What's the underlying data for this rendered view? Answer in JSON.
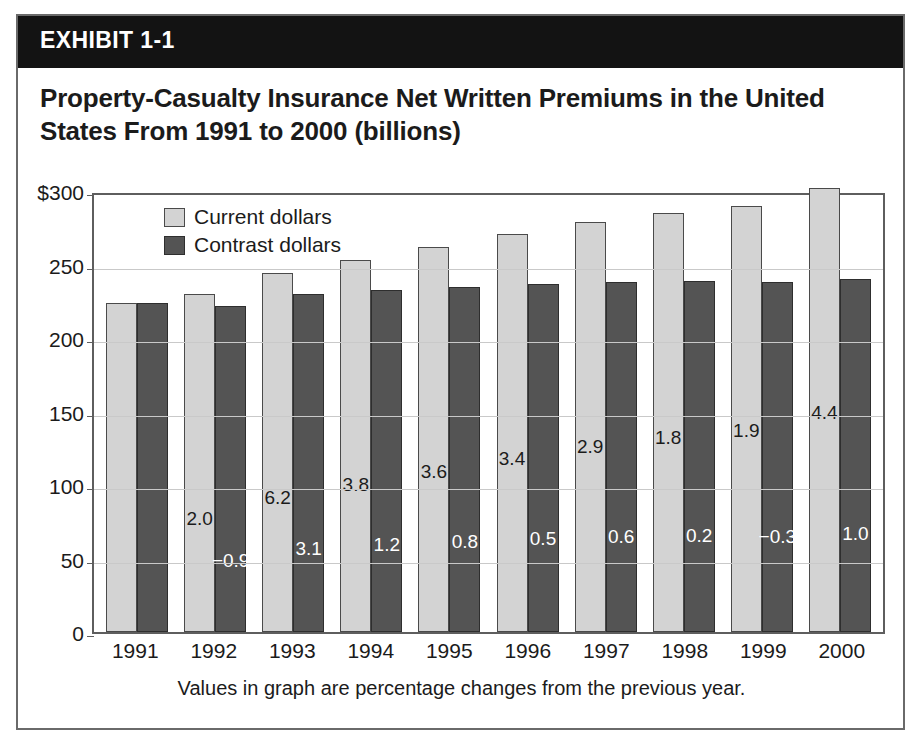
{
  "exhibit": {
    "band_label": "EXHIBIT 1-1",
    "title": "Property-Casualty Insurance Net Written Premiums in the United States From 1991 to 2000 (billions)"
  },
  "chart_data": {
    "type": "bar",
    "title": "Property-Casualty Insurance Net Written Premiums in the United States From 1991 to 2000 (billions)",
    "xlabel": "",
    "ylabel": "",
    "ylim": [
      0,
      300
    ],
    "yticks": [
      "$300",
      "250",
      "200",
      "150",
      "100",
      "50",
      "0"
    ],
    "ytick_values": [
      300,
      250,
      200,
      150,
      100,
      50,
      0
    ],
    "grid": true,
    "legend_position": "top-left",
    "categories": [
      "1991",
      "1992",
      "1993",
      "1994",
      "1995",
      "1996",
      "1997",
      "1998",
      "1999",
      "2000"
    ],
    "series": [
      {
        "name": "Current dollars",
        "color": "#d3d3d3",
        "values": [
          224,
          230,
          244,
          253,
          262,
          271,
          279,
          285,
          290,
          302
        ],
        "point_labels": [
          "",
          "2.0",
          "6.2",
          "3.8",
          "3.6",
          "3.4",
          "2.9",
          "1.8",
          "1.9",
          "4.4"
        ]
      },
      {
        "name": "Contrast dollars",
        "color": "#545454",
        "values": [
          224,
          222,
          230,
          233,
          235,
          237,
          238,
          239,
          238,
          240
        ],
        "point_labels": [
          "",
          "−0.9",
          "3.1",
          "1.2",
          "0.8",
          "0.5",
          "0.6",
          "0.2",
          "−0.3",
          "1.0"
        ]
      }
    ],
    "annotation": "Values in graph are percentage changes from the previous year."
  }
}
